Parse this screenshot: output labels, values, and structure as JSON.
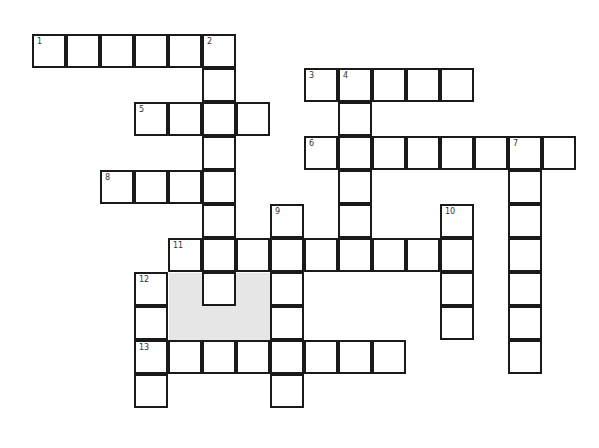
{
  "puzzle": {
    "cell_size": 34,
    "origin": {
      "x": 33,
      "y": 35
    },
    "colors": {
      "border": "#1a1a1a",
      "cell": "#ffffff",
      "shaded": "#e6e6e6"
    },
    "shaded_region": {
      "col": 4,
      "row": 7,
      "cols": 3,
      "rows": 2
    },
    "entries": [
      {
        "number": "1",
        "direction": "across",
        "row": 0,
        "col": 0,
        "length": 6
      },
      {
        "number": "2",
        "direction": "down",
        "row": 0,
        "col": 5,
        "length": 8
      },
      {
        "number": "3",
        "direction": "across",
        "row": 1,
        "col": 8,
        "length": 5
      },
      {
        "number": "4",
        "direction": "down",
        "row": 1,
        "col": 9,
        "length": 6
      },
      {
        "number": "5",
        "direction": "across",
        "row": 2,
        "col": 3,
        "length": 4
      },
      {
        "number": "6",
        "direction": "across",
        "row": 3,
        "col": 8,
        "length": 8
      },
      {
        "number": "7",
        "direction": "down",
        "row": 3,
        "col": 14,
        "length": 7
      },
      {
        "number": "8",
        "direction": "across",
        "row": 4,
        "col": 2,
        "length": 4
      },
      {
        "number": "9",
        "direction": "down",
        "row": 5,
        "col": 7,
        "length": 6
      },
      {
        "number": "10",
        "direction": "down",
        "row": 5,
        "col": 12,
        "length": 4
      },
      {
        "number": "11",
        "direction": "across",
        "row": 6,
        "col": 4,
        "length": 9
      },
      {
        "number": "12",
        "direction": "down",
        "row": 7,
        "col": 3,
        "length": 4
      },
      {
        "number": "13",
        "direction": "across",
        "row": 9,
        "col": 3,
        "length": 8
      }
    ]
  }
}
